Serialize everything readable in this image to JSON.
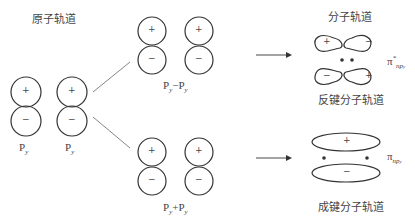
{
  "titles": {
    "atomic": "原子轨道",
    "molecular": "分子轨道",
    "antibonding": "反键分子轨道",
    "bonding": "成键分子轨道"
  },
  "atomic_orbitals": [
    {
      "label": "P",
      "sub": "y",
      "top_sign": "+",
      "bottom_sign": "−"
    },
    {
      "label": "P",
      "sub": "y",
      "top_sign": "+",
      "bottom_sign": "−"
    }
  ],
  "combinations": {
    "minus": {
      "label": "P",
      "sub1": "y",
      "op": "−",
      "label2": "P",
      "sub2": "y"
    },
    "plus": {
      "label": "P",
      "sub1": "y",
      "op": "+",
      "label2": "P",
      "sub2": "y"
    }
  },
  "antibonding_orbital": {
    "label": "π",
    "sup": "*",
    "sub": "np",
    "subsub": "y",
    "lobes": [
      "+",
      "−",
      "−",
      "+"
    ]
  },
  "bonding_orbital": {
    "label": "π",
    "sub": "np",
    "subsub": "y",
    "lobes": [
      "+",
      "−"
    ]
  },
  "signs": {
    "plus": "+",
    "minus": "−"
  }
}
